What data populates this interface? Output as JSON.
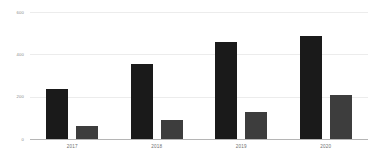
{
  "chart_data": {
    "type": "bar",
    "title": "",
    "subtitle": "",
    "xlabel": "",
    "ylabel": "",
    "categories": [
      "2017",
      "2018",
      "2019",
      "2020"
    ],
    "series": [
      {
        "name": "series-1",
        "color": "#1a1a1a",
        "values": [
          235,
          355,
          460,
          485
        ]
      },
      {
        "name": "series-2",
        "color": "#3d3d3d",
        "values": [
          62,
          90,
          128,
          208
        ]
      }
    ],
    "ylim": [
      0,
      600
    ],
    "yticks": [
      0,
      200,
      400,
      600
    ],
    "ytick_labels": [
      "0",
      "200",
      "400",
      "600"
    ],
    "grid": true,
    "grid_color": "#ececec",
    "axis_color": "#b5b5b5",
    "legend": false,
    "legend_position": "none",
    "background": "#ffffff",
    "annotations": []
  }
}
